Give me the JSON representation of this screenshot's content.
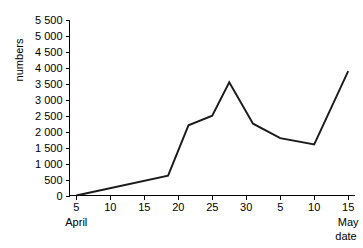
{
  "chart_data": {
    "type": "line",
    "title": "",
    "subtitle": "",
    "xlabel": "date",
    "ylabel": "numbers",
    "grid": false,
    "legend": "none",
    "x_tick_labels": [
      "5",
      "10",
      "15",
      "20",
      "25",
      "30",
      "5",
      "10",
      "15"
    ],
    "x_tick_values": [
      5,
      10,
      15,
      20,
      25,
      30,
      35,
      40,
      45
    ],
    "xlim": [
      4,
      46
    ],
    "y_tick_labels": [
      "0",
      "500",
      "1 000",
      "1 500",
      "2 000",
      "2 500",
      "3 000",
      "3 500",
      "4 000",
      "4 500",
      "5 000",
      "5 500"
    ],
    "y_tick_values": [
      0,
      500,
      1000,
      1500,
      2000,
      2500,
      3000,
      3500,
      4000,
      4500,
      5000,
      5500
    ],
    "ylim": [
      0,
      5500
    ],
    "period_labels": [
      {
        "text": "April",
        "x_value": 5
      },
      {
        "text": "May",
        "x_value": 45
      }
    ],
    "series": [
      {
        "name": "numbers",
        "x": [
          5,
          18.5,
          21.5,
          25,
          27.5,
          31,
          35,
          40,
          45
        ],
        "y": [
          0,
          620,
          2200,
          2500,
          3550,
          2250,
          1800,
          1600,
          3900
        ],
        "x_date_labels": [
          "April 5",
          "April 18.5",
          "April 21.5",
          "April 25",
          "April 27.5",
          "May 1",
          "May 5",
          "May 10",
          "May 15"
        ],
        "color": "#1a1a1a"
      }
    ]
  },
  "axis": {
    "y_label": "numbers",
    "x_label": "date"
  }
}
